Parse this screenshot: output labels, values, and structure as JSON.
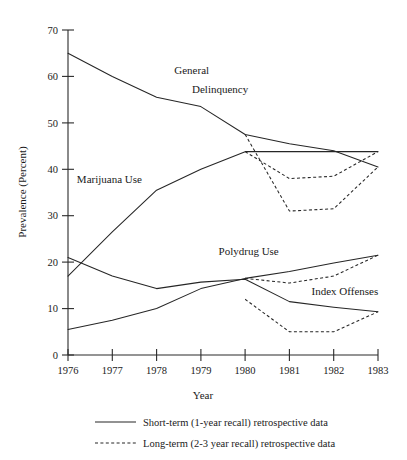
{
  "chart_data": {
    "type": "line",
    "title": "",
    "xlabel": "Year",
    "ylabel": "Prevalence (Percent)",
    "x": [
      1976,
      1977,
      1978,
      1979,
      1980,
      1981,
      1982,
      1983
    ],
    "xtick_labels": [
      "1976",
      "1977",
      "1978",
      "1979",
      "1980",
      "1981",
      "1982",
      "1983"
    ],
    "ytick_labels": [
      "0",
      "10",
      "20",
      "30",
      "40",
      "50",
      "60",
      "70"
    ],
    "ytick_values": [
      0,
      10,
      20,
      30,
      40,
      50,
      60,
      70
    ],
    "xlim": [
      1976,
      1983
    ],
    "ylim": [
      0,
      70
    ],
    "grid": false,
    "legend_position": "below-axis",
    "series": [
      {
        "name": "General Delinquency",
        "style": "short-term",
        "values": [
          65.0,
          60.0,
          55.5,
          53.5,
          47.5,
          45.5,
          44.0,
          40.5
        ]
      },
      {
        "name": "General Delinquency (long-term)",
        "style": "long-term",
        "values": [
          null,
          null,
          null,
          null,
          47.5,
          31.0,
          31.5,
          40.5
        ]
      },
      {
        "name": "Marijuana Use",
        "style": "short-term",
        "values": [
          17.0,
          26.5,
          35.5,
          40.0,
          43.8,
          43.8,
          43.8,
          43.8
        ]
      },
      {
        "name": "Marijuana Use (long-term)",
        "style": "long-term",
        "values": [
          null,
          null,
          null,
          null,
          43.8,
          38.0,
          38.5,
          43.8
        ]
      },
      {
        "name": "Polydrug Use",
        "style": "short-term",
        "values": [
          5.5,
          7.5,
          10.0,
          14.3,
          16.5,
          18.0,
          19.8,
          21.5
        ]
      },
      {
        "name": "Polydrug Use (long-term)",
        "style": "long-term",
        "values": [
          null,
          null,
          null,
          null,
          16.5,
          15.5,
          17.0,
          21.5
        ]
      },
      {
        "name": "Index Offenses",
        "style": "short-term",
        "values": [
          21.0,
          17.0,
          14.3,
          15.7,
          16.3,
          11.5,
          10.3,
          9.3
        ]
      },
      {
        "name": "Index Offenses (long-term)",
        "style": "long-term",
        "values": [
          null,
          null,
          null,
          null,
          12.0,
          5.0,
          5.0,
          9.3
        ]
      }
    ],
    "annotations": [
      {
        "text": "General",
        "x": 1978.4,
        "y": 60.5
      },
      {
        "text": "Delinquency",
        "x": 1978.8,
        "y": 56.5
      },
      {
        "text": "Marijuana  Use",
        "x": 1976.2,
        "y": 37.0
      },
      {
        "text": "Polydrug Use",
        "x": 1979.4,
        "y": 21.5
      },
      {
        "text": "Index Offenses",
        "x": 1981.5,
        "y": 13.0
      }
    ],
    "legend": [
      {
        "style": "short-term",
        "label": "Short-term (1-year recall) retrospective data"
      },
      {
        "style": "long-term",
        "label": "Long-term (2-3 year recall) retrospective data"
      }
    ],
    "colors": {
      "line": "#262626",
      "axis": "#2a2a2a",
      "background": "#ffffff"
    }
  }
}
